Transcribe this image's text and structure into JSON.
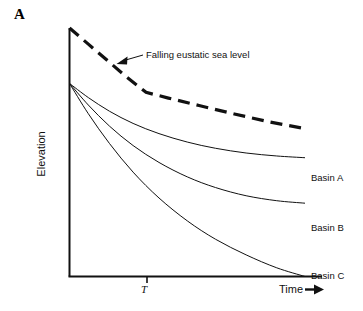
{
  "figure": {
    "panel_label": "A",
    "axis": {
      "y_label": "Elevation",
      "x_label": "Time",
      "x_arrow_glyph": "arrow-right-icon",
      "tick_label": "T"
    },
    "annotation": {
      "text": "Falling eustatic sea level",
      "pointer": "arrow-down-left-icon"
    },
    "series_labels": {
      "a": "Basin A",
      "b": "Basin B",
      "c": "Basin C"
    }
  },
  "chart_data": {
    "type": "line",
    "title": "",
    "xlabel": "Time",
    "ylabel": "Elevation",
    "xlim": [
      0,
      1
    ],
    "ylim": [
      0,
      1
    ],
    "grid": false,
    "legend": "inline-right",
    "axis_style": "schematic-no-numeric-ticks",
    "xticks": [
      {
        "x": 0.33,
        "label": "T"
      }
    ],
    "annotations": [
      {
        "text": "Falling eustatic sea level",
        "target_x": 0.21,
        "target_y": 0.79,
        "label_x": 0.33,
        "label_y": 0.83
      }
    ],
    "series": [
      {
        "name": "Falling eustatic sea level",
        "style": "dashed",
        "width": 3.2,
        "color": "#111111",
        "points": [
          {
            "x": 0.0,
            "y": 1.0
          },
          {
            "x": 0.08,
            "y": 0.935
          },
          {
            "x": 0.16,
            "y": 0.87
          },
          {
            "x": 0.24,
            "y": 0.805
          },
          {
            "x": 0.325,
            "y": 0.741
          },
          {
            "x": 0.42,
            "y": 0.718
          },
          {
            "x": 0.55,
            "y": 0.688
          },
          {
            "x": 0.7,
            "y": 0.654
          },
          {
            "x": 0.85,
            "y": 0.622
          },
          {
            "x": 1.0,
            "y": 0.595
          }
        ]
      },
      {
        "name": "Basin A",
        "style": "solid",
        "width": 1,
        "color": "#111111",
        "points": [
          {
            "x": 0.0,
            "y": 0.777
          },
          {
            "x": 0.08,
            "y": 0.72
          },
          {
            "x": 0.17,
            "y": 0.665
          },
          {
            "x": 0.27,
            "y": 0.616
          },
          {
            "x": 0.38,
            "y": 0.575
          },
          {
            "x": 0.5,
            "y": 0.541
          },
          {
            "x": 0.62,
            "y": 0.516
          },
          {
            "x": 0.75,
            "y": 0.497
          },
          {
            "x": 0.88,
            "y": 0.485
          },
          {
            "x": 1.0,
            "y": 0.478
          }
        ]
      },
      {
        "name": "Basin B",
        "style": "solid",
        "width": 1,
        "color": "#111111",
        "points": [
          {
            "x": 0.0,
            "y": 0.777
          },
          {
            "x": 0.08,
            "y": 0.69
          },
          {
            "x": 0.17,
            "y": 0.605
          },
          {
            "x": 0.27,
            "y": 0.527
          },
          {
            "x": 0.38,
            "y": 0.459
          },
          {
            "x": 0.5,
            "y": 0.401
          },
          {
            "x": 0.62,
            "y": 0.358
          },
          {
            "x": 0.75,
            "y": 0.325
          },
          {
            "x": 0.88,
            "y": 0.305
          },
          {
            "x": 1.0,
            "y": 0.295
          }
        ]
      },
      {
        "name": "Basin C",
        "style": "solid",
        "width": 1,
        "color": "#111111",
        "points": [
          {
            "x": 0.0,
            "y": 0.777
          },
          {
            "x": 0.08,
            "y": 0.655
          },
          {
            "x": 0.17,
            "y": 0.535
          },
          {
            "x": 0.27,
            "y": 0.42
          },
          {
            "x": 0.38,
            "y": 0.316
          },
          {
            "x": 0.5,
            "y": 0.224
          },
          {
            "x": 0.62,
            "y": 0.15
          },
          {
            "x": 0.75,
            "y": 0.087
          },
          {
            "x": 0.88,
            "y": 0.035
          },
          {
            "x": 1.0,
            "y": 0.0
          }
        ]
      }
    ]
  }
}
